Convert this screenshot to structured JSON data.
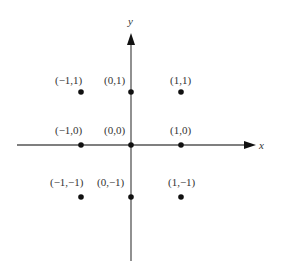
{
  "diagram": {
    "axes": {
      "x_label": "x",
      "y_label": "y",
      "color": "#555555"
    },
    "point_color": "#111111",
    "points": [
      {
        "label": "(−1,1)",
        "x": -1,
        "y": 1
      },
      {
        "label": "(0,1)",
        "x": 0,
        "y": 1
      },
      {
        "label": "(1,1)",
        "x": 1,
        "y": 1
      },
      {
        "label": "(−1,0)",
        "x": -1,
        "y": 0
      },
      {
        "label": "(0,0)",
        "x": 0,
        "y": 0
      },
      {
        "label": "(1,0)",
        "x": 1,
        "y": 0
      },
      {
        "label": "(−1,−1)",
        "x": -1,
        "y": -1
      },
      {
        "label": "(0,−1)",
        "x": 0,
        "y": -1
      },
      {
        "label": "(1,−1)",
        "x": 1,
        "y": -1
      }
    ]
  }
}
